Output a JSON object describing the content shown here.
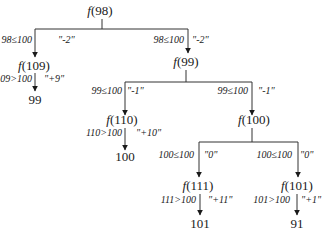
{
  "diagram": {
    "nodes": {
      "root": {
        "fn": "f",
        "arg": "(98)"
      },
      "n109": {
        "fn": "f",
        "arg": "(109)"
      },
      "r99": {
        "value": "99"
      },
      "n99": {
        "fn": "f",
        "arg": "(99)"
      },
      "n110": {
        "fn": "f",
        "arg": "(110)"
      },
      "r100": {
        "value": "100"
      },
      "n100": {
        "fn": "f",
        "arg": "(100)"
      },
      "n111": {
        "fn": "f",
        "arg": "(111)"
      },
      "r101": {
        "value": "101"
      },
      "n101": {
        "fn": "f",
        "arg": "(101)"
      },
      "r91": {
        "value": "91"
      }
    },
    "edges": {
      "root_left": {
        "cond": "98≤100",
        "label": "\"-2\""
      },
      "root_right": {
        "cond": "98≤100",
        "label": "\"-2\""
      },
      "n109_down": {
        "cond": "109>100",
        "label": "\"+9\""
      },
      "n99_left": {
        "cond": "99≤100",
        "label": "\"-1\""
      },
      "n99_right": {
        "cond": "99≤100",
        "label": "\"-1\""
      },
      "n110_down": {
        "cond": "110>100",
        "label": "\"+10\""
      },
      "n100_left": {
        "cond": "100≤100",
        "label": "\"0\""
      },
      "n100_right": {
        "cond": "100≤100",
        "label": "\"0\""
      },
      "n111_down": {
        "cond": "111>100",
        "label": "\"+11\""
      },
      "n101_down": {
        "cond": "101>100",
        "label": "\"+1\""
      }
    }
  }
}
